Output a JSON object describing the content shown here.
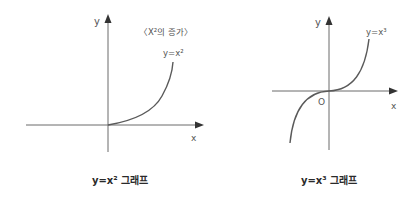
{
  "graphs": [
    {
      "id": "square",
      "caption": "y=x² 그래프",
      "axis_x_label": "x",
      "axis_y_label": "y",
      "curve_label": "y=x²",
      "annotation": "〈X²의 증가〉",
      "origin_label": ""
    },
    {
      "id": "cube",
      "caption": "y=x³ 그래프",
      "axis_x_label": "x",
      "axis_y_label": "y",
      "curve_label": "y=x³",
      "annotation": "",
      "origin_label": "O"
    }
  ],
  "colors": {
    "axis": "#6b6b6b",
    "curve": "#5a5a5a",
    "label": "#555555",
    "caption": "#2a2a2a"
  }
}
